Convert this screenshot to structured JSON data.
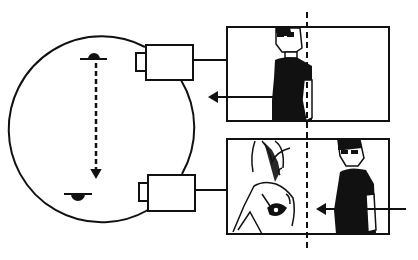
{
  "diagram": {
    "colors": {
      "ink": "#111111",
      "paper": "#ffffff"
    },
    "elements": {
      "set_circle": {
        "cx": 100,
        "cy": 127,
        "r": 93
      },
      "actor_top": {
        "x": 93,
        "y": 58
      },
      "actor_bottom": {
        "x": 76,
        "y": 195
      },
      "axis_line": {
        "x1": 96,
        "y1": 60,
        "x2": 96,
        "y2": 174,
        "style": "dashed",
        "arrow": "down"
      },
      "camera_top": {
        "x": 145,
        "y": 44,
        "w": 48,
        "h": 37
      },
      "camera_bottom": {
        "x": 148,
        "y": 174,
        "w": 47,
        "h": 37
      },
      "frame_top": {
        "x": 227,
        "y": 27,
        "w": 162,
        "h": 94
      },
      "frame_bottom": {
        "x": 227,
        "y": 139,
        "w": 162,
        "h": 95
      },
      "screen_axis": {
        "x": 307,
        "y1": 12,
        "y2": 252,
        "style": "dashed"
      },
      "arrow_top": {
        "from_x": 298,
        "to_x": 208,
        "y": 97,
        "direction": "left"
      },
      "arrow_bottom": {
        "from_x": 406,
        "to_x": 316,
        "y": 209,
        "direction": "left"
      }
    }
  }
}
